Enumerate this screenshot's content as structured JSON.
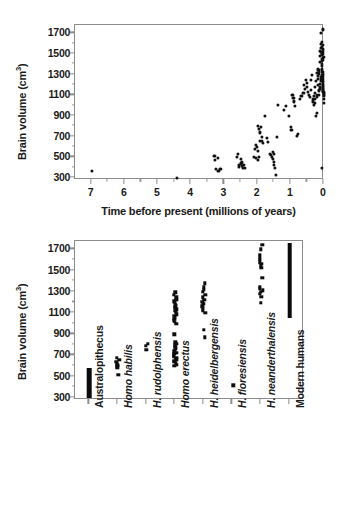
{
  "figure": {
    "background": "#ffffff",
    "axis_color": "#8c8c8c",
    "marker_color": "#111111"
  },
  "chart_data": [
    {
      "id": "brain-volume-vs-time",
      "type": "scatter",
      "title": "",
      "xlabel": "Time before present (millions of years)",
      "ylabel": "Brain volume (cm",
      "ylabel_sup": "3",
      "ylabel_close": ")",
      "xlim": [
        7.5,
        0
      ],
      "ylim": [
        280,
        1780
      ],
      "x_reversed": true,
      "grid": false,
      "legend": "none",
      "xticks": [
        7,
        6,
        5,
        4,
        3,
        2,
        1,
        0
      ],
      "xticklabels": [
        "7",
        "6",
        "5",
        "4",
        "3",
        "2",
        "1",
        "0"
      ],
      "xminorticks": [
        6.5,
        5.5,
        4.5,
        3.5,
        2.5,
        1.5,
        0.5
      ],
      "yticks": [
        300,
        500,
        700,
        900,
        1100,
        1300,
        1500,
        1700
      ],
      "yticklabels": [
        "300",
        "500",
        "700",
        "900",
        "1100",
        "1300",
        "1500",
        "1700"
      ],
      "yminorticks": [
        400,
        600,
        800,
        1000,
        1200,
        1400,
        1600
      ],
      "points": [
        [
          7.0,
          370
        ],
        [
          4.42,
          300
        ],
        [
          3.3,
          515
        ],
        [
          3.28,
          470
        ],
        [
          3.2,
          490
        ],
        [
          3.25,
          390
        ],
        [
          3.18,
          370
        ],
        [
          3.12,
          385
        ],
        [
          2.62,
          500
        ],
        [
          2.58,
          530
        ],
        [
          2.55,
          430
        ],
        [
          2.5,
          440
        ],
        [
          2.48,
          415
        ],
        [
          2.45,
          400
        ],
        [
          2.42,
          430
        ],
        [
          2.5,
          485
        ],
        [
          2.46,
          450
        ],
        [
          2.38,
          395
        ],
        [
          2.55,
          405
        ],
        [
          2.05,
          615
        ],
        [
          2.02,
          600
        ],
        [
          2.08,
          580
        ],
        [
          1.98,
          560
        ],
        [
          2.0,
          800
        ],
        [
          1.96,
          770
        ],
        [
          1.92,
          740
        ],
        [
          1.9,
          790
        ],
        [
          1.88,
          700
        ],
        [
          1.94,
          660
        ],
        [
          2.1,
          500
        ],
        [
          2.06,
          490
        ],
        [
          2.0,
          475
        ],
        [
          1.95,
          505
        ],
        [
          1.86,
          660
        ],
        [
          1.84,
          640
        ],
        [
          1.78,
          900
        ],
        [
          1.72,
          690
        ],
        [
          1.68,
          645
        ],
        [
          1.62,
          530
        ],
        [
          1.6,
          520
        ],
        [
          1.58,
          500
        ],
        [
          1.55,
          480
        ],
        [
          1.52,
          455
        ],
        [
          1.5,
          430
        ],
        [
          1.48,
          400
        ],
        [
          1.46,
          330
        ],
        [
          1.55,
          555
        ],
        [
          1.52,
          535
        ],
        [
          1.42,
          700
        ],
        [
          1.38,
          1010
        ],
        [
          1.2,
          960
        ],
        [
          1.15,
          1000
        ],
        [
          1.05,
          900
        ],
        [
          1.0,
          790
        ],
        [
          0.98,
          760
        ],
        [
          0.95,
          1105
        ],
        [
          0.92,
          1075
        ],
        [
          0.9,
          1040
        ],
        [
          0.88,
          995
        ],
        [
          0.82,
          710
        ],
        [
          0.78,
          730
        ],
        [
          0.72,
          1060
        ],
        [
          0.68,
          1090
        ],
        [
          0.62,
          1120
        ],
        [
          0.6,
          1200
        ],
        [
          0.58,
          1160
        ],
        [
          0.55,
          1250
        ],
        [
          0.52,
          1180
        ],
        [
          0.5,
          1215
        ],
        [
          0.48,
          1130
        ],
        [
          0.45,
          1100
        ],
        [
          0.42,
          1085
        ],
        [
          0.4,
          1150
        ],
        [
          0.38,
          1250
        ],
        [
          0.36,
          1300
        ],
        [
          0.34,
          1060
        ],
        [
          0.32,
          1040
        ],
        [
          0.3,
          1090
        ],
        [
          0.28,
          1120
        ],
        [
          0.26,
          1180
        ],
        [
          0.25,
          1240
        ],
        [
          0.24,
          900
        ],
        [
          0.22,
          930
        ],
        [
          0.2,
          1320
        ],
        [
          0.19,
          1290
        ],
        [
          0.18,
          1260
        ],
        [
          0.17,
          1200
        ],
        [
          0.16,
          1150
        ],
        [
          0.15,
          1100
        ],
        [
          0.14,
          1345
        ],
        [
          0.13,
          1420
        ],
        [
          0.12,
          1480
        ],
        [
          0.11,
          1530
        ],
        [
          0.1,
          1700
        ],
        [
          0.09,
          1600
        ],
        [
          0.085,
          1560
        ],
        [
          0.08,
          1520
        ],
        [
          0.075,
          1490
        ],
        [
          0.07,
          1455
        ],
        [
          0.065,
          1430
        ],
        [
          0.06,
          1400
        ],
        [
          0.055,
          1380
        ],
        [
          0.05,
          1350
        ],
        [
          0.048,
          1330
        ],
        [
          0.045,
          1310
        ],
        [
          0.042,
          1300
        ],
        [
          0.04,
          1280
        ],
        [
          0.038,
          1260
        ],
        [
          0.035,
          1240
        ],
        [
          0.033,
          1225
        ],
        [
          0.03,
          1210
        ],
        [
          0.028,
          1195
        ],
        [
          0.026,
          1180
        ],
        [
          0.024,
          1170
        ],
        [
          0.022,
          1160
        ],
        [
          0.02,
          1150
        ],
        [
          0.018,
          1140
        ],
        [
          0.016,
          1130
        ],
        [
          0.015,
          1120
        ],
        [
          0.014,
          1110
        ],
        [
          0.012,
          1100
        ],
        [
          0.01,
          1090
        ],
        [
          0.03,
          1500
        ],
        [
          0.025,
          1520
        ],
        [
          0.02,
          1545
        ],
        [
          0.04,
          1540
        ],
        [
          0.05,
          1570
        ],
        [
          0.045,
          1590
        ],
        [
          0.06,
          1620
        ],
        [
          0.02,
          1440
        ],
        [
          0.03,
          1460
        ],
        [
          0.015,
          1470
        ],
        [
          0.055,
          1505
        ],
        [
          0.07,
          1300
        ],
        [
          0.08,
          1280
        ],
        [
          0.09,
          1260
        ],
        [
          0.1,
          1240
        ],
        [
          0.11,
          1210
        ],
        [
          0.12,
          1180
        ],
        [
          0.13,
          1160
        ],
        [
          0.14,
          1140
        ],
        [
          0.15,
          1310
        ],
        [
          0.16,
          1330
        ],
        [
          0.18,
          1350
        ],
        [
          0.2,
          1100
        ],
        [
          0.22,
          1080
        ],
        [
          0.26,
          1060
        ],
        [
          0.28,
          1030
        ],
        [
          0.3,
          1010
        ],
        [
          0.04,
          1745
        ],
        [
          0.02,
          1735
        ],
        [
          0.01,
          1030
        ],
        [
          0.005,
          1060
        ],
        [
          0.05,
          400
        ]
      ]
    },
    {
      "id": "brain-volume-by-species",
      "type": "scatter",
      "title": "",
      "xlabel": "",
      "ylabel": "Brain volume (cm",
      "ylabel_sup": "3",
      "ylabel_close": ")",
      "ylim": [
        280,
        1780
      ],
      "grid": false,
      "legend": "none",
      "yticks": [
        300,
        500,
        700,
        900,
        1100,
        1300,
        1500,
        1700
      ],
      "yticklabels": [
        "300",
        "500",
        "700",
        "900",
        "1100",
        "1300",
        "1500",
        "1700"
      ],
      "yminorticks": [
        400,
        600,
        800,
        1000,
        1200,
        1400,
        1600
      ],
      "categories": [
        "Australopithecus",
        "Homo habilis",
        "H. rudolphensis",
        "Homo erectus",
        "H. heidelbergensis",
        "H. floresiensis",
        "H. neanderthalensis",
        "Modern humans"
      ],
      "category_styles": [
        "upright",
        "italic",
        "italic",
        "italic",
        "italic",
        "italic",
        "italic",
        "upright"
      ],
      "series": [
        {
          "name": "Australopithecus",
          "render": "bar",
          "range": [
            300,
            580
          ],
          "values": [
            300,
            580
          ]
        },
        {
          "name": "Homo habilis",
          "render": "dots",
          "values": [
            520,
            590,
            600,
            612,
            625,
            640,
            660,
            680
          ]
        },
        {
          "name": "H. rudolphensis",
          "render": "dots",
          "values": [
            752,
            790,
            808
          ]
        },
        {
          "name": "Homo erectus",
          "render": "dots",
          "values": [
            600,
            612,
            625,
            640,
            652,
            665,
            678,
            690,
            700,
            715,
            728,
            740,
            752,
            765,
            780,
            795,
            810,
            825,
            900,
            1000,
            1015,
            1030,
            1045,
            1060,
            1075,
            1090,
            1105,
            1120,
            1135,
            1150,
            1165,
            1180,
            1195,
            1210,
            1225,
            1250,
            1275,
            1295
          ]
        },
        {
          "name": "H. heidelbergensis",
          "render": "dots",
          "values": [
            870,
            940,
            1100,
            1120,
            1145,
            1165,
            1185,
            1205,
            1225,
            1250,
            1275,
            1300,
            1320,
            1345,
            1380
          ]
        },
        {
          "name": "H. floresiensis",
          "render": "dots",
          "values": [
            420
          ]
        },
        {
          "name": "H. neanderthalensis",
          "render": "dots",
          "values": [
            1195,
            1255,
            1280,
            1300,
            1315,
            1330,
            1350,
            1430,
            1530,
            1550,
            1565,
            1580,
            1600,
            1625,
            1650,
            1700,
            1745
          ]
        },
        {
          "name": "Modern humans",
          "render": "bar",
          "range": [
            1050,
            1760
          ],
          "values": [
            1050,
            1760
          ]
        }
      ]
    }
  ]
}
